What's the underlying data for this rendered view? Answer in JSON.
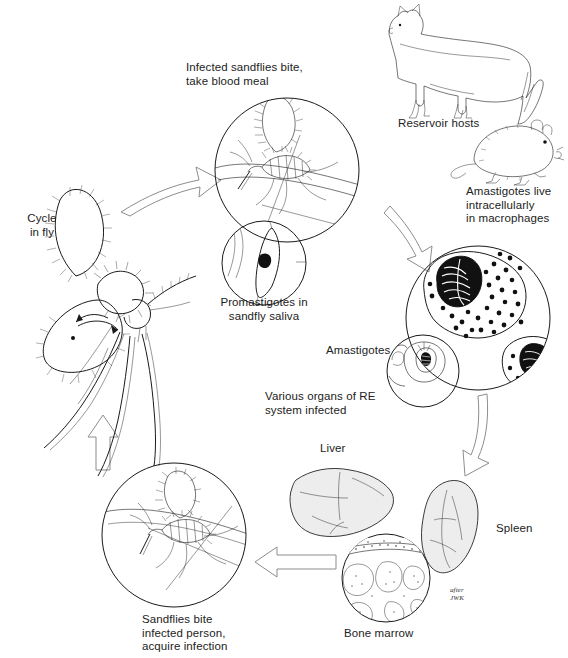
{
  "diagram": {
    "signature_line1": "after",
    "signature_line2": "JWK",
    "colors": {
      "ink": "#1a1a1a",
      "arrow_outline": "#8d8d8d",
      "organ_fill": "#ededed",
      "text": "#222222",
      "background": "#ffffff"
    },
    "labels": {
      "infected_sandflies": "Infected sandflies bite,\ntake blood meal",
      "reservoir_hosts": "Reservoir hosts",
      "amastigotes_live": "Amastigotes live\nintracellularly\nin macrophages",
      "promastigotes": "Promastigotes in\nsandfly saliva",
      "cycle_in_fly": "Cycle\nin fly",
      "amastigotes": "Amastigotes",
      "various_organs": "Various organs of RE\nsystem infected",
      "liver": "Liver",
      "spleen": "Spleen",
      "bone_marrow": "Bone marrow",
      "sandflies_bite": "Sandflies bite\ninfected person,\nacquire infection"
    },
    "figures": {
      "dog": "reservoir-host-dog",
      "rodent": "reservoir-host-rodent",
      "sandfly_large": "sandfly-vector",
      "macrophage": "infected-macrophage",
      "promastigote": "promastigote",
      "liver_organ": "liver",
      "spleen_organ": "spleen",
      "bone_marrow_organ": "bone-marrow"
    }
  }
}
